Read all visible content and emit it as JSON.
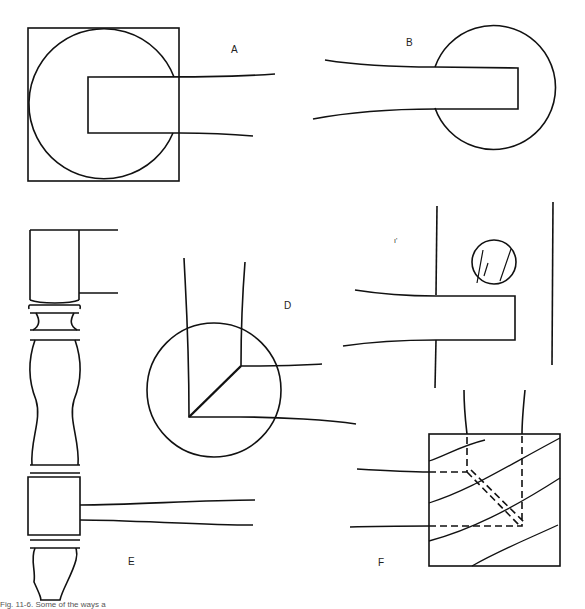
{
  "figure": {
    "panels": [
      {
        "id": "A",
        "label": "A",
        "description": "Round tenon in square post, rail end shaped to circle"
      },
      {
        "id": "B",
        "label": "B",
        "description": "Rail tenon into round post"
      },
      {
        "id": "C",
        "label": "C",
        "description": "Rail tenon through post with dowel"
      },
      {
        "id": "D",
        "label": "D",
        "description": "Corner joint in round leg, mitered tenons"
      },
      {
        "id": "E",
        "label": "E",
        "description": "Turned leg with square blocks receiving rails"
      },
      {
        "id": "F",
        "label": "F",
        "description": "Square leg corner with intersecting tenons, grain lines"
      }
    ],
    "caption": "Fig. 11-6. Some of the ways a"
  },
  "colors": {
    "line": "#111111",
    "background": "#ffffff"
  }
}
